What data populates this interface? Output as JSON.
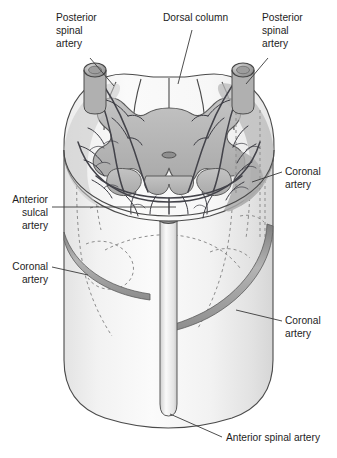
{
  "figure": {
    "width": 337,
    "height": 458,
    "background": "#ffffff"
  },
  "labels": [
    {
      "id": "posterior-spinal-artery-left",
      "text": "Posterior\nspinal\nartery",
      "lines": [
        "Posterior",
        "spinal",
        "artery"
      ],
      "x": 56,
      "y": 21,
      "align": "start"
    },
    {
      "id": "dorsal-column",
      "text": "Dorsal column",
      "lines": [
        "Dorsal column"
      ],
      "x": 163,
      "y": 22,
      "align": "start"
    },
    {
      "id": "posterior-spinal-artery-right",
      "text": "Posterior\nspinal\nartery",
      "lines": [
        "Posterior",
        "spinal",
        "artery"
      ],
      "x": 262,
      "y": 21,
      "align": "start"
    },
    {
      "id": "coronal-artery-right-upper",
      "text": "Coronal\nartery",
      "lines": [
        "Coronal",
        "artery"
      ],
      "x": 285,
      "y": 175,
      "align": "start"
    },
    {
      "id": "anterior-sulcal-artery",
      "text": "Anterior\nsulcal\nartery",
      "lines": [
        "Anterior",
        "sulcal",
        "artery"
      ],
      "x": 48,
      "y": 210,
      "align": "end"
    },
    {
      "id": "coronal-artery-left",
      "text": "Coronal\nartery",
      "lines": [
        "Coronal",
        "artery"
      ],
      "x": 48,
      "y": 270,
      "align": "end"
    },
    {
      "id": "coronal-artery-right-lower",
      "text": "Coronal\nartery",
      "lines": [
        "Coronal",
        "artery"
      ],
      "x": 285,
      "y": 324,
      "align": "start"
    },
    {
      "id": "anterior-spinal-artery",
      "text": "Anterior spinal artery",
      "lines": [
        "Anterior spinal artery"
      ],
      "x": 226,
      "y": 440,
      "align": "start"
    }
  ],
  "anatomy": {
    "grey_matter_label": "grey-matter-butterfly",
    "central_canal_label": "central-canal",
    "cord_body_label": "spinal-cord-cylinder",
    "anterior_spinal_artery_label": "anterior-spinal-artery-trunk",
    "coronal_band_upper_label": "coronal-artery-band-upper",
    "coronal_band_lower_label": "coronal-artery-band-lower",
    "psa_left_label": "posterior-spinal-artery-left-vessel",
    "psa_right_label": "posterior-spinal-artery-right-vessel"
  },
  "colors": {
    "outline": "#4a4a4a",
    "white_matter": "#f3f3f3",
    "grey_matter": "#b7b7b7",
    "vessel": "#43434a",
    "artery_band": "#9c9c9c",
    "dashed_hidden": "#8d8d8d",
    "text": "#1d1d1d",
    "background": "#ffffff"
  }
}
